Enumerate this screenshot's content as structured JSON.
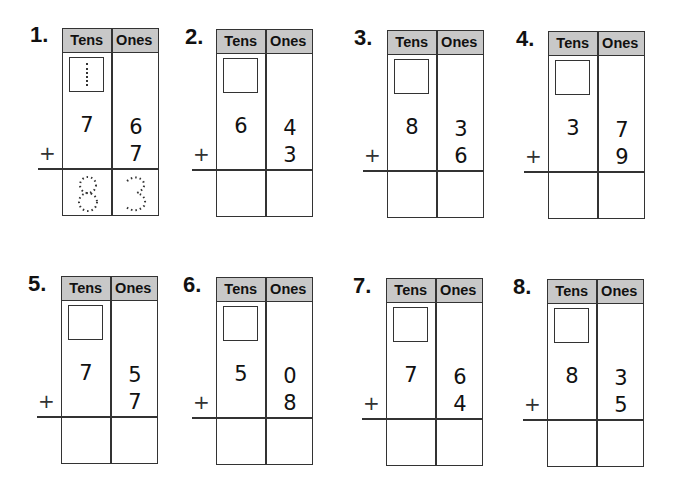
{
  "headers": {
    "tens": "Tens",
    "ones": "Ones"
  },
  "plus_sign": "+",
  "problems": [
    {
      "number": "1.",
      "top_tens": "7",
      "top_ones": "6",
      "add_ones": "7",
      "answer_tens": "8",
      "answer_ones": "3",
      "carry_hint": "1",
      "worked_example": true
    },
    {
      "number": "2.",
      "top_tens": "6",
      "top_ones": "4",
      "add_ones": "3",
      "answer_tens": "",
      "answer_ones": ""
    },
    {
      "number": "3.",
      "top_tens": "8",
      "top_ones": "3",
      "add_ones": "6",
      "answer_tens": "",
      "answer_ones": ""
    },
    {
      "number": "4.",
      "top_tens": "3",
      "top_ones": "7",
      "add_ones": "9",
      "answer_tens": "",
      "answer_ones": ""
    },
    {
      "number": "5.",
      "top_tens": "7",
      "top_ones": "5",
      "add_ones": "7",
      "answer_tens": "",
      "answer_ones": ""
    },
    {
      "number": "6.",
      "top_tens": "5",
      "top_ones": "0",
      "add_ones": "8",
      "answer_tens": "",
      "answer_ones": ""
    },
    {
      "number": "7.",
      "top_tens": "7",
      "top_ones": "6",
      "add_ones": "4",
      "answer_tens": "",
      "answer_ones": ""
    },
    {
      "number": "8.",
      "top_tens": "8",
      "top_ones": "3",
      "add_ones": "5",
      "answer_tens": "",
      "answer_ones": ""
    }
  ]
}
